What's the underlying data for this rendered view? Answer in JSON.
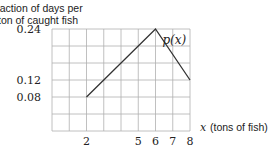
{
  "chart_data": {
    "type": "line",
    "title": "",
    "ylabel": [
      "fraction of days per",
      "ton of caught fish"
    ],
    "xlabel_var": "x",
    "xlabel": "(tons of fish)",
    "x": [
      2,
      6,
      8
    ],
    "series": [
      {
        "name": "p(x)",
        "values": [
          0.08,
          0.24,
          0.12
        ]
      }
    ],
    "xlim": [
      0,
      8
    ],
    "ylim": [
      0,
      0.24
    ],
    "x_ticks": [
      2,
      5,
      6,
      7,
      8
    ],
    "x_tick_labels": [
      "2",
      "5",
      "6",
      "7",
      "8"
    ],
    "y_ticks": [
      0.08,
      0.12,
      0.24
    ],
    "y_tick_labels": [
      "0.08",
      "0.12",
      "0.24"
    ],
    "grid": true,
    "grid_x_step": 1,
    "grid_y_step": 0.04,
    "legend": "inline label near peak",
    "line_color": "#333333",
    "grid_color": "#b0b0b0"
  }
}
